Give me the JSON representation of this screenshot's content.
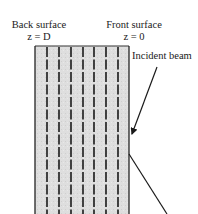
{
  "labels": {
    "back_surface": {
      "title": "Back surface",
      "position": "z = D"
    },
    "front_surface": {
      "title": "Front surface",
      "position": "z = 0"
    },
    "incident_beam": "Incident beam"
  },
  "sample": {
    "fill_color": "#dcdcdc",
    "border_color": "#222222",
    "layer_lines": 7,
    "layer_line_style": "dashed"
  },
  "beams": {
    "incident": {
      "from": [
        157,
        67
      ],
      "to": [
        131,
        137
      ],
      "arrowhead": true
    },
    "reflected": {
      "from": [
        129,
        154
      ],
      "to": [
        167,
        214
      ],
      "arrowhead": false
    },
    "color": "#1a1a1a"
  }
}
